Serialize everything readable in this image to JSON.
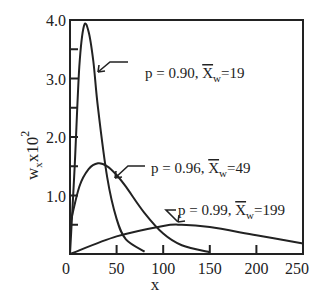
{
  "chart_data": {
    "type": "line",
    "title": "",
    "xlabel": "x",
    "ylabel": "w_x x10^2",
    "ylabel_main": "w",
    "ylabel_sub": "x",
    "ylabel_mult": "x10",
    "ylabel_exp": "2",
    "xlim": [
      0,
      250
    ],
    "ylim": [
      0,
      4.0
    ],
    "x_ticks": [
      0,
      50,
      100,
      150,
      200,
      250
    ],
    "x_tick_labels": [
      "0",
      "50",
      "100",
      "150",
      "200",
      "250"
    ],
    "y_ticks": [
      0,
      0.5,
      1.0,
      1.5,
      2.0,
      2.5,
      3.0,
      3.5,
      4.0
    ],
    "y_tick_labels": [
      "1.0",
      "2.0",
      "3.0",
      "4.0"
    ],
    "grid": false,
    "legend": "annotations",
    "series": [
      {
        "name": "p = 0.90, X̄w=19",
        "p": 0.9,
        "xw": 19,
        "annotation": {
          "prefix": "p = 0.90, ",
          "xbar": "X",
          "sub": "w",
          "suffix": "=19"
        },
        "x": [
          0,
          5,
          10,
          15,
          20,
          25,
          30,
          40,
          50,
          60,
          80
        ],
        "values": [
          0,
          1.5,
          3.2,
          3.9,
          3.8,
          3.3,
          2.5,
          1.3,
          0.6,
          0.25,
          0.04
        ]
      },
      {
        "name": "p = 0.96, X̄w=49",
        "p": 0.96,
        "xw": 49,
        "annotation": {
          "prefix": "p = 0.96, ",
          "xbar": "X",
          "sub": "w",
          "suffix": "=49"
        },
        "x": [
          0,
          10,
          20,
          30,
          40,
          50,
          60,
          80,
          100,
          120,
          150
        ],
        "values": [
          0.5,
          1.15,
          1.45,
          1.55,
          1.5,
          1.35,
          1.15,
          0.7,
          0.35,
          0.15,
          0.03
        ]
      },
      {
        "name": "p = 0.99, X̄w=199",
        "p": 0.99,
        "xw": 199,
        "annotation": {
          "prefix": "p = 0.99, ",
          "xbar": "X",
          "sub": "w",
          "suffix": "=199"
        },
        "x": [
          0,
          50,
          100,
          120,
          150,
          200,
          250
        ],
        "values": [
          0,
          0.3,
          0.48,
          0.5,
          0.46,
          0.32,
          0.18
        ]
      }
    ]
  }
}
